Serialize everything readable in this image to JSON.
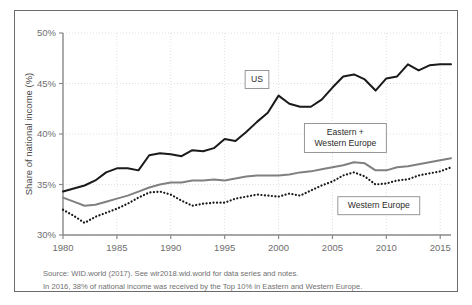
{
  "chart_data": {
    "type": "line",
    "title": "",
    "subtitle": "",
    "xlabel": "",
    "ylabel": "Share of national income (%)",
    "xlim": [
      1980,
      2016
    ],
    "ylim": [
      30,
      50
    ],
    "y_tick_labels": [
      "30%",
      "35%",
      "40%",
      "45%",
      "50%"
    ],
    "y_ticks": [
      30,
      35,
      40,
      45,
      50
    ],
    "x_ticks": [
      1980,
      1985,
      1990,
      1995,
      2000,
      2005,
      2010,
      2015
    ],
    "x_tick_labels": [
      "1980",
      "1985",
      "1990",
      "1995",
      "2000",
      "2005",
      "2010",
      "2015"
    ],
    "grid": true,
    "legend_position": "inline-annotations",
    "x": [
      1980,
      1981,
      1982,
      1983,
      1984,
      1985,
      1986,
      1987,
      1988,
      1989,
      1990,
      1991,
      1992,
      1993,
      1994,
      1995,
      1996,
      1997,
      1998,
      1999,
      2000,
      2001,
      2002,
      2003,
      2004,
      2005,
      2006,
      2007,
      2008,
      2009,
      2010,
      2011,
      2012,
      2013,
      2014,
      2015,
      2016
    ],
    "series": [
      {
        "name": "US",
        "color": "#1a1a1a",
        "style": "solid",
        "values": [
          34.3,
          34.6,
          34.9,
          35.4,
          36.2,
          36.6,
          36.6,
          36.4,
          37.9,
          38.1,
          38.0,
          37.8,
          38.4,
          38.3,
          38.6,
          39.5,
          39.3,
          40.2,
          41.2,
          42.1,
          43.8,
          43.0,
          42.7,
          42.7,
          43.4,
          44.6,
          45.7,
          45.9,
          45.4,
          44.3,
          45.5,
          45.7,
          46.9,
          46.3,
          46.8,
          46.9,
          46.9
        ]
      },
      {
        "name": "Eastern + Western Europe",
        "color": "#808080",
        "style": "solid",
        "values": [
          33.7,
          33.3,
          32.9,
          33.0,
          33.3,
          33.6,
          33.9,
          34.3,
          34.7,
          35.0,
          35.2,
          35.2,
          35.4,
          35.4,
          35.5,
          35.4,
          35.6,
          35.8,
          35.9,
          35.9,
          35.9,
          36.0,
          36.2,
          36.3,
          36.5,
          36.7,
          36.9,
          37.2,
          37.1,
          36.4,
          36.4,
          36.7,
          36.8,
          37.0,
          37.2,
          37.4,
          37.6
        ]
      },
      {
        "name": "Western Europe",
        "color": "#1a1a1a",
        "style": "dotted",
        "values": [
          32.5,
          31.9,
          31.2,
          31.8,
          32.2,
          32.6,
          33.1,
          33.7,
          34.2,
          34.3,
          34.0,
          33.4,
          32.9,
          33.1,
          33.2,
          33.2,
          33.6,
          33.8,
          34.0,
          33.9,
          33.8,
          34.1,
          33.9,
          34.4,
          34.9,
          35.3,
          35.9,
          36.2,
          35.8,
          35.0,
          35.1,
          35.4,
          35.5,
          35.9,
          36.1,
          36.3,
          36.7
        ]
      }
    ],
    "annotations": [
      {
        "text": "US",
        "x": 1998,
        "y": 45.4,
        "box": true
      },
      {
        "text_line1": "Eastern +",
        "text_line2": "Western Europe",
        "x": 2006.2,
        "y": 39.6,
        "box": true
      },
      {
        "text": "Western Europe",
        "x": 2009.3,
        "y": 32.9,
        "box": true
      }
    ]
  },
  "footnotes": {
    "source_line": "Source:  WID.world (2017). See wir2018.wid.world for data series and notes.",
    "note_line": "In 2016, 38% of national income was received by the Top 10% in Eastern and Western Europe."
  }
}
